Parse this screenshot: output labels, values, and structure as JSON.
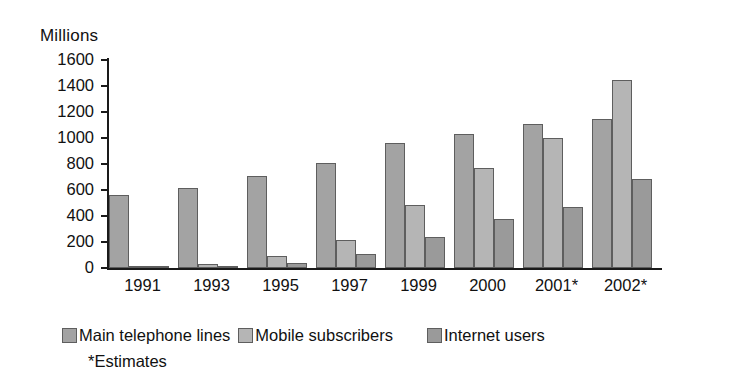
{
  "chart_data": {
    "type": "bar",
    "title": "",
    "subtitle": "",
    "unit_label": "Millions",
    "xlabel": "",
    "ylabel": "Millions",
    "ylim": [
      0,
      1600
    ],
    "ytick_step": 200,
    "yticks": [
      1600,
      1400,
      1200,
      1000,
      800,
      600,
      400,
      200,
      0
    ],
    "grid": false,
    "legend_position": "bottom",
    "categories": [
      "1991",
      "1993",
      "1995",
      "1997",
      "1999",
      "2000",
      "2001*",
      "2002*"
    ],
    "series": [
      {
        "name": "Main telephone lines",
        "color": "#a3a3a3",
        "values": [
          560,
          615,
          710,
          810,
          960,
          1030,
          1110,
          1150
        ]
      },
      {
        "name": "Mobile subscribers",
        "color": "#b5b5b5",
        "values": [
          0,
          30,
          90,
          215,
          485,
          770,
          1000,
          1450
        ]
      },
      {
        "name": "Internet users",
        "color": "#9a9a9a",
        "values": [
          5,
          10,
          40,
          105,
          235,
          375,
          470,
          685
        ]
      }
    ],
    "annotations": [
      "*Estimates"
    ]
  },
  "legend": {
    "items": [
      {
        "label": "Main telephone lines"
      },
      {
        "label": "Mobile subscribers"
      },
      {
        "label": "Internet users"
      }
    ]
  },
  "footnote": "*Estimates"
}
